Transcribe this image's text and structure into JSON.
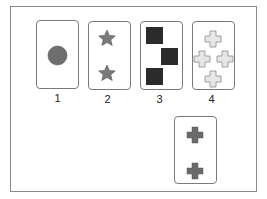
{
  "diagram": {
    "cards": [
      {
        "id": 1,
        "label": "1",
        "shape": "circle",
        "count": 1,
        "fill": "#6e6e6e"
      },
      {
        "id": 2,
        "label": "2",
        "shape": "star",
        "count": 2,
        "fill": "#7a7a7a"
      },
      {
        "id": 3,
        "label": "3",
        "shape": "square",
        "count": 3,
        "fill": "#2b2b2b"
      },
      {
        "id": 4,
        "label": "4",
        "shape": "cross",
        "count": 4,
        "fill": "#e6e6e6"
      },
      {
        "id": 5,
        "label": "",
        "shape": "cross",
        "count": 2,
        "fill": "#6a6a6a"
      }
    ],
    "colors": {
      "frame": "#8a8a8a",
      "card_border": "#7a7a7a"
    }
  }
}
